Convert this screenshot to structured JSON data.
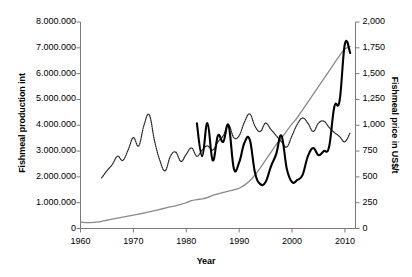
{
  "chart_data": {
    "type": "line",
    "title": "",
    "subtitle": "",
    "xlabel": "Year",
    "ylabel": "Fishmeal production int",
    "ylabel_right": "Fishmeal price in US$/t",
    "xlim": [
      1960,
      2012
    ],
    "ylim": [
      0,
      8000000
    ],
    "ylim_right": [
      0,
      2000
    ],
    "grid": false,
    "legend_position": "none",
    "xticks": [
      1960,
      1970,
      1980,
      1990,
      2000,
      2010
    ],
    "xtick_labels": [
      "1960",
      "1970",
      "1980",
      "1990",
      "2000",
      "2010"
    ],
    "yticks_left": [
      0,
      1000000,
      2000000,
      3000000,
      4000000,
      5000000,
      6000000,
      7000000,
      8000000
    ],
    "ytick_labels_left": [
      "0",
      "1.000.000",
      "2.000.000",
      "3.000.000",
      "4.000.000",
      "5.000.000",
      "6.000.000",
      "7.000.000",
      "8.000.000"
    ],
    "yticks_right": [
      0,
      250,
      500,
      750,
      1000,
      1250,
      1500,
      1750,
      2000
    ],
    "ytick_labels_right": [
      "0",
      "250",
      "500",
      "750",
      "1,000",
      "1,250",
      "1,500",
      "1,750",
      "2,000"
    ],
    "series": [
      {
        "name": "Fishmeal production int",
        "axis": "left",
        "style": "solid-gray",
        "color": "#8a8a8a",
        "x": [
          1960,
          1961,
          1962,
          1963,
          1964,
          1965,
          1966,
          1967,
          1968,
          1969,
          1970,
          1971,
          1972,
          1973,
          1974,
          1975,
          1976,
          1977,
          1978,
          1979,
          1980,
          1981,
          1982,
          1983,
          1984,
          1985,
          1986,
          1987,
          1988,
          1989,
          1990,
          1991,
          1992,
          1993,
          1994,
          1995,
          1996,
          1997,
          1998,
          1999,
          2000,
          2001,
          2002,
          2003,
          2004,
          2005,
          2006,
          2007,
          2008,
          2009,
          2010,
          2011
        ],
        "values": [
          250000,
          225000,
          230000,
          250000,
          280000,
          320000,
          360000,
          400000,
          440000,
          480000,
          520000,
          560000,
          600000,
          640000,
          690000,
          740000,
          790000,
          840000,
          880000,
          930000,
          1000000,
          1080000,
          1120000,
          1150000,
          1200000,
          1280000,
          1340000,
          1400000,
          1450000,
          1500000,
          1560000,
          1680000,
          1850000,
          2080000,
          2350000,
          2650000,
          2950000,
          3250000,
          3500000,
          3780000,
          4050000,
          4300000,
          4600000,
          4900000,
          5200000,
          5500000,
          5800000,
          6100000,
          6400000,
          6700000,
          6950000,
          7050000
        ]
      },
      {
        "name": "Fishmeal price (dotted)",
        "axis": "right",
        "style": "dotted",
        "color": "#2b2b2b",
        "x": [
          1964,
          1965,
          1966,
          1967,
          1968,
          1969,
          1970,
          1971,
          1972,
          1973,
          1974,
          1975,
          1976,
          1977,
          1978,
          1979,
          1980,
          1981,
          1982,
          1983,
          1984,
          1985,
          1986,
          1987,
          1988,
          1989,
          1990,
          1991,
          1992,
          1993,
          1994,
          1995,
          1996,
          1997,
          1998,
          1999,
          2000,
          2001,
          2002,
          2003,
          2004,
          2005,
          2006,
          2007,
          2008,
          2009,
          2010,
          2011
        ],
        "values": [
          490,
          560,
          620,
          700,
          660,
          760,
          880,
          800,
          1000,
          1100,
          850,
          660,
          560,
          700,
          740,
          650,
          720,
          780,
          700,
          760,
          800,
          760,
          840,
          900,
          1000,
          880,
          900,
          1030,
          1110,
          990,
          940,
          1020,
          960,
          900,
          840,
          790,
          900,
          1010,
          1070,
          1020,
          940,
          1020,
          1040,
          980,
          930,
          890,
          840,
          930
        ]
      },
      {
        "name": "Fishmeal price (solid black)",
        "axis": "right",
        "style": "solid-black",
        "color": "#000000",
        "x": [
          1982,
          1983,
          1984,
          1985,
          1986,
          1987,
          1988,
          1989,
          1990,
          1991,
          1992,
          1993,
          1994,
          1995,
          1996,
          1997,
          1998,
          1999,
          2000,
          2001,
          2002,
          2003,
          2004,
          2005,
          2006,
          2007,
          2008,
          2009,
          2010,
          2011
        ],
        "values": [
          1020,
          700,
          1020,
          660,
          900,
          840,
          1000,
          580,
          640,
          830,
          860,
          540,
          430,
          450,
          600,
          720,
          900,
          580,
          450,
          470,
          520,
          700,
          780,
          710,
          750,
          790,
          1180,
          1240,
          1790,
          1700
        ]
      }
    ]
  },
  "axes": {
    "left_title": "Fishmeal production int",
    "right_title": "Fishmeal price in US$/t",
    "x_title": "Year"
  }
}
